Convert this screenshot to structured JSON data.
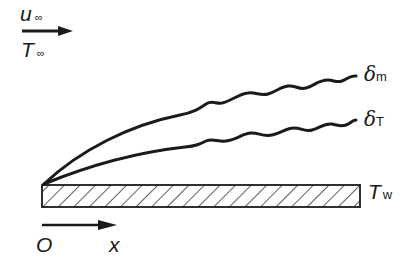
{
  "diagram": {
    "freestream": {
      "velocity_label": "u",
      "velocity_sub": "∞",
      "temperature_label": "T",
      "temperature_sub": "∞"
    },
    "boundary_layers": [
      {
        "symbol": "δ",
        "sub": "m",
        "name": "momentum boundary layer"
      },
      {
        "symbol": "δ",
        "sub": "T",
        "name": "thermal boundary layer"
      }
    ],
    "plate": {
      "wall_temp_label": "T",
      "wall_temp_sub": "w"
    },
    "axis": {
      "origin_label": "O",
      "x_label": "x"
    },
    "colors": {
      "ink": "#1a1a1a",
      "background": "#ffffff"
    }
  }
}
